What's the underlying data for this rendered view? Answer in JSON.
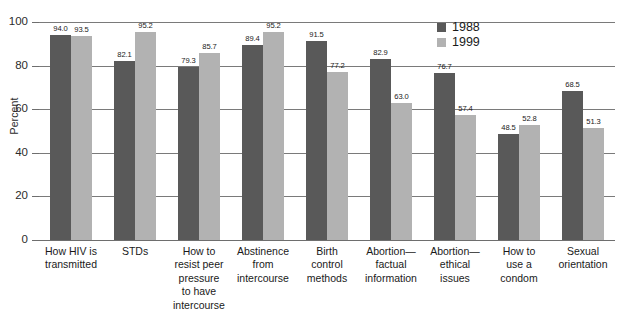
{
  "chart_data": {
    "type": "bar",
    "title": "",
    "xlabel": "",
    "ylabel": "Percent",
    "ylim": [
      0,
      100
    ],
    "yticks": [
      0,
      20,
      40,
      60,
      80,
      100
    ],
    "ytick_labels": [
      "0",
      "20",
      "40",
      "60",
      "80",
      "100"
    ],
    "grid": true,
    "legend_position": "top-right",
    "categories": [
      "How HIV is\ntransmitted",
      "STDs",
      "How to\nresist peer\npressure\nto have\nintercourse",
      "Abstinence\nfrom\nintercourse",
      "Birth\ncontrol\nmethods",
      "Abortion—\nfactual\ninformation",
      "Abortion—\nethical\nissues",
      "How to\nuse a\ncondom",
      "Sexual\norientation"
    ],
    "series": [
      {
        "name": "1988",
        "color": "#595959",
        "values": [
          94.0,
          82.1,
          79.3,
          89.4,
          91.5,
          82.9,
          76.7,
          48.5,
          68.5
        ],
        "value_labels": [
          "94.0",
          "82.1",
          "79.3",
          "89.4",
          "91.5",
          "82.9",
          "76.7",
          "48.5",
          "68.5"
        ]
      },
      {
        "name": "1999",
        "color": "#b2b2b2",
        "values": [
          93.5,
          95.2,
          85.7,
          95.2,
          77.2,
          63.0,
          57.4,
          52.8,
          51.3
        ],
        "value_labels": [
          "93.5",
          "95.2",
          "85.7",
          "95.2",
          "77.2",
          "63.0",
          "57.4",
          "52.8",
          "51.3"
        ]
      }
    ]
  },
  "colors": {
    "series_1988": "#595959",
    "series_1999": "#b2b2b2",
    "gridline": "#7a7a7a",
    "axis": "#6e6e6e",
    "text": "#1a1a1a",
    "background": "#ffffff"
  }
}
